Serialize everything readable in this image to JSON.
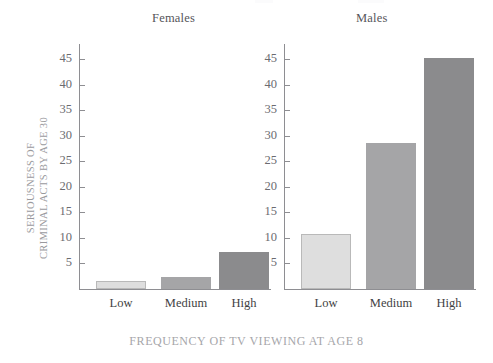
{
  "figure": {
    "axis_title_y_line1": "SERIOUSNESS OF",
    "axis_title_y_line2": "CRIMINAL ACTS BY AGE 30",
    "axis_title_x": "FREQUENCY OF TV VIEWING AT AGE 8",
    "panel_title_left": "Females",
    "panel_title_right": "Males"
  },
  "colors": {
    "bar_low": "#dedede",
    "bar_low_border": "#b9b9b9",
    "bar_medium": "#a5a5a7",
    "bar_high": "#8b8b8d",
    "axis": "#8e8e92",
    "tick_text": "#6b6b70",
    "panel_title_text": "#56565a",
    "axis_title_text": "#a6a6aa",
    "background": "#ffffff"
  },
  "ticks": {
    "values": [
      45,
      40,
      35,
      30,
      25,
      20,
      15,
      10,
      5
    ],
    "labels": [
      "45",
      "40",
      "35",
      "30",
      "25",
      "20",
      "15",
      "10",
      "5"
    ]
  },
  "categories": [
    "Low",
    "Medium",
    "High"
  ],
  "chart_data": {
    "type": "bar",
    "title": "",
    "xlabel": "FREQUENCY OF TV VIEWING AT AGE 8",
    "ylabel": "SERIOUSNESS OF CRIMINAL ACTS BY AGE 30",
    "categories": [
      "Low",
      "Medium",
      "High"
    ],
    "ylim": [
      0,
      48
    ],
    "ytick_values": [
      5,
      10,
      15,
      20,
      25,
      30,
      35,
      40,
      45
    ],
    "grid": false,
    "legend": "none",
    "panels": [
      {
        "name": "Females",
        "categories": [
          "Low",
          "Medium",
          "High"
        ],
        "values": [
          1.5,
          2.4,
          7.3
        ]
      },
      {
        "name": "Males",
        "categories": [
          "Low",
          "Medium",
          "High"
        ],
        "values": [
          10.7,
          28.7,
          45.3
        ]
      }
    ],
    "series": [
      {
        "name": "Females",
        "values": [
          1.5,
          2.4,
          7.3
        ]
      },
      {
        "name": "Males",
        "values": [
          10.7,
          28.7,
          45.3
        ]
      }
    ]
  }
}
